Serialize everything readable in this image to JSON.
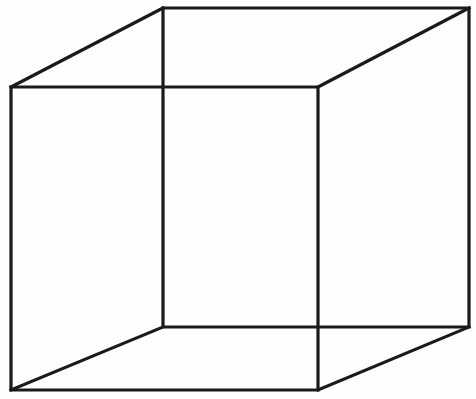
{
  "figure": {
    "name": "Necker cube",
    "background_color": "#fefefe",
    "line_color": "#1a1a1a",
    "line_width_px": 3.2,
    "canvas": {
      "width": 476,
      "height": 399
    },
    "vertices": {
      "front_top_left": {
        "x": 11,
        "y": 87
      },
      "front_top_right": {
        "x": 318,
        "y": 87
      },
      "front_bottom_right": {
        "x": 318,
        "y": 390
      },
      "front_bottom_left": {
        "x": 11,
        "y": 390
      },
      "back_top_left": {
        "x": 163,
        "y": 8
      },
      "back_top_right": {
        "x": 469,
        "y": 8
      },
      "back_bottom_right": {
        "x": 469,
        "y": 327
      },
      "back_bottom_left": {
        "x": 163,
        "y": 327
      }
    },
    "edges": [
      {
        "name": "front-face",
        "points": "11,87 318,87 318,390 11,390 11,87"
      },
      {
        "name": "back-face",
        "points": "163,8 469,8 469,327 163,327 163,8"
      },
      {
        "name": "connector-top-left",
        "points": "11,87 163,8"
      },
      {
        "name": "connector-top-right",
        "points": "318,87 469,8"
      },
      {
        "name": "connector-bottom-right",
        "points": "318,390 469,327"
      },
      {
        "name": "connector-bottom-left",
        "points": "11,390 163,327"
      }
    ]
  },
  "bleed_through": [
    {
      "text": "",
      "x": 120,
      "y": 168
    },
    {
      "text": "",
      "x": 150,
      "y": 182
    },
    {
      "text": "",
      "x": 40,
      "y": 244
    },
    {
      "text": "",
      "x": 30,
      "y": 262
    },
    {
      "text": "",
      "x": 60,
      "y": 300
    },
    {
      "text": "",
      "x": 20,
      "y": 330
    }
  ]
}
